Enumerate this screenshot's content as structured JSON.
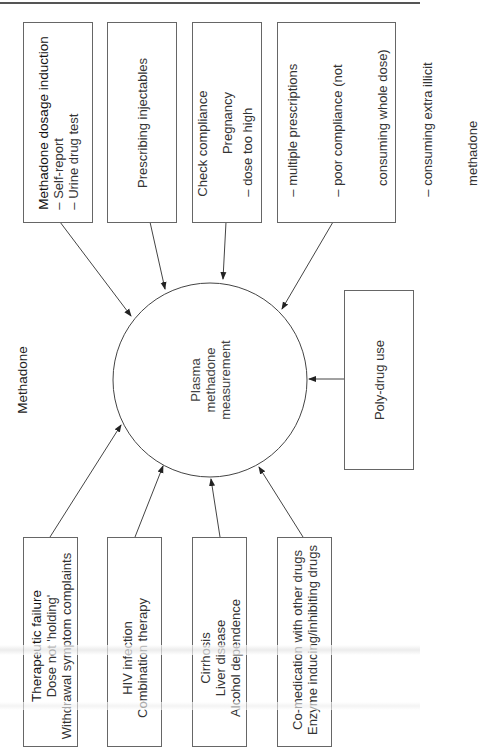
{
  "diagram": {
    "title": "Methadone",
    "center_node": {
      "lines": [
        "Plasma",
        "methadone",
        "measurement"
      ]
    },
    "top_boxes": [
      {
        "id": "dosage-induction",
        "lines": [
          "Methadone dosage induction",
          "– Self-report",
          "– Urine drug test"
        ]
      },
      {
        "id": "prescribing-injectables",
        "lines": [
          "Prescribing injectables"
        ]
      },
      {
        "id": "pregnancy",
        "lines": [
          "Pregnancy"
        ]
      },
      {
        "id": "check-compliance",
        "lines": [
          "Check compliance",
          "– dose too high",
          "– multiple prescriptions",
          "– poor compliance (not",
          "   consuming whole dose)",
          "– consuming extra illicit",
          "   methadone"
        ]
      }
    ],
    "right_box": {
      "id": "poly-drug-use",
      "lines": [
        "Poly-drug use"
      ]
    },
    "bottom_boxes": [
      {
        "id": "therapeutic-failure",
        "lines": [
          "Therapeutic failure",
          "Dose not 'holding'",
          "Withdrawal symptom complaints"
        ]
      },
      {
        "id": "hiv-infection",
        "lines": [
          "HIV infection",
          "Combination therapy"
        ]
      },
      {
        "id": "cirrhosis",
        "lines": [
          "Cirrhosis",
          "Liver disease",
          "Alcohol dependence"
        ]
      },
      {
        "id": "co-medication",
        "lines": [
          "Co-medication with other drugs",
          "Enzyme inducing/inhibiting drugs"
        ]
      }
    ],
    "edges": [
      {
        "from": "dosage-induction",
        "to": "center"
      },
      {
        "from": "prescribing-injectables",
        "to": "center"
      },
      {
        "from": "pregnancy",
        "to": "center"
      },
      {
        "from": "check-compliance",
        "to": "center"
      },
      {
        "from": "poly-drug-use",
        "to": "center"
      },
      {
        "from": "therapeutic-failure",
        "to": "center"
      },
      {
        "from": "hiv-infection",
        "to": "center"
      },
      {
        "from": "cirrhosis",
        "to": "center"
      },
      {
        "from": "co-medication",
        "to": "center"
      }
    ]
  }
}
